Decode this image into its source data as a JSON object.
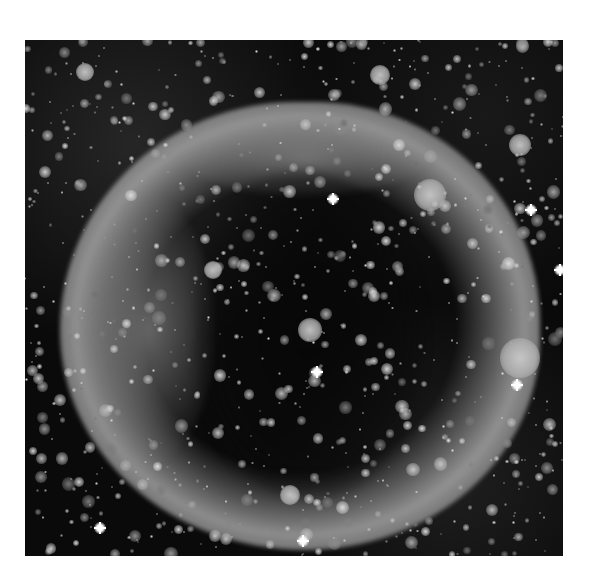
{
  "image": {
    "subject": "ring nebula shell over dense star field",
    "colors": {
      "background": "#0a0a0a",
      "nebula": "#b9b9b9",
      "page": "#ffffff"
    },
    "frame": {
      "left": 25,
      "top": 40,
      "width": 538,
      "height": 516
    },
    "bright_stars": [
      {
        "x": 308,
        "y": 159
      },
      {
        "x": 292,
        "y": 332
      },
      {
        "x": 506,
        "y": 170
      },
      {
        "x": 492,
        "y": 345
      },
      {
        "x": 75,
        "y": 488
      },
      {
        "x": 278,
        "y": 501
      },
      {
        "x": 535,
        "y": 230
      }
    ],
    "blobs": [
      {
        "x": 405,
        "y": 155,
        "r": 16
      },
      {
        "x": 495,
        "y": 318,
        "r": 20
      },
      {
        "x": 285,
        "y": 290,
        "r": 12
      },
      {
        "x": 355,
        "y": 35,
        "r": 10
      },
      {
        "x": 495,
        "y": 105,
        "r": 11
      },
      {
        "x": 265,
        "y": 455,
        "r": 10
      },
      {
        "x": 188,
        "y": 230,
        "r": 9
      },
      {
        "x": 60,
        "y": 32,
        "r": 9
      }
    ]
  }
}
